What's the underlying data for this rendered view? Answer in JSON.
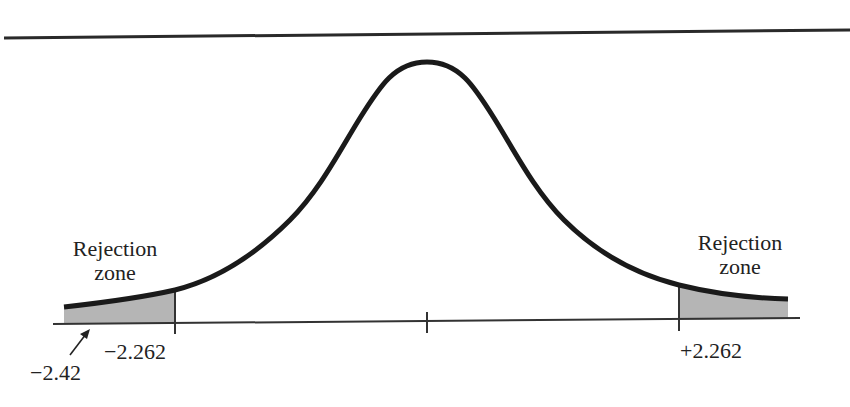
{
  "diagram": {
    "type": "t-distribution two-tailed rejection regions",
    "curve_color": "#1a1a1a",
    "shade_color": "#b5b5b5",
    "axis_color": "#333333",
    "left_zone": {
      "line1": "Rejection",
      "line2": "zone"
    },
    "right_zone": {
      "line1": "Rejection",
      "line2": "zone"
    },
    "critical_left": "−2.262",
    "critical_right": "+2.262",
    "observed_value": "−2.42"
  }
}
